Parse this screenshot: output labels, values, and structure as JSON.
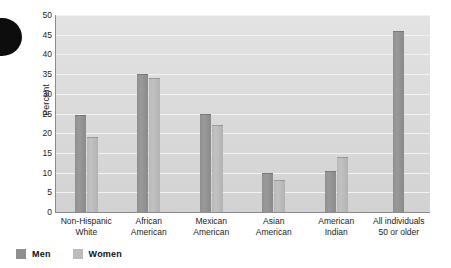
{
  "chart_data": {
    "type": "bar",
    "title": "",
    "xlabel": "",
    "ylabel": "Percent",
    "ylim": [
      0,
      50
    ],
    "yticks": [
      50,
      45,
      40,
      35,
      30,
      25,
      20,
      15,
      10,
      5,
      0
    ],
    "grid": true,
    "legend_position": "bottom-left",
    "categories": [
      "Non-Hispanic White",
      "African American",
      "Mexican American",
      "Asian American",
      "American Indian",
      "All individuals 50 or older"
    ],
    "category_lines": [
      [
        "Non-Hispanic",
        "White"
      ],
      [
        "African",
        "American"
      ],
      [
        "Mexican",
        "American"
      ],
      [
        "Asian",
        "American"
      ],
      [
        "American",
        "Indian"
      ],
      [
        "All individuals",
        "50 or older"
      ]
    ],
    "series": [
      {
        "name": "Men",
        "color": "#8f8f8f",
        "values": [
          24.5,
          35,
          25,
          10,
          10.5,
          46
        ]
      },
      {
        "name": "Women",
        "color": "#bcbcbc",
        "values": [
          19,
          34,
          22,
          8,
          14,
          null
        ]
      }
    ]
  },
  "legend": {
    "items": [
      {
        "label": "Men",
        "swatch": "men-swatch"
      },
      {
        "label": "Women",
        "swatch": "women-swatch"
      }
    ]
  },
  "colors": {
    "men_bar": "#8f8f8f",
    "women_bar": "#bcbcbc",
    "plot_background": "#dcdcdc",
    "gridline": "#f2f2f2",
    "axis": "#8c8c8c",
    "text": "#1c1c1c"
  }
}
